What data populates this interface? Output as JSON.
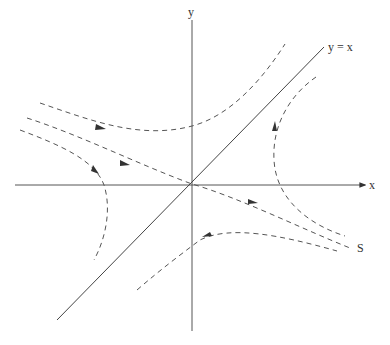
{
  "diagram": {
    "axes": {
      "x_label": "x",
      "y_label": "y"
    },
    "diagonal_label": "y = x",
    "separatrix_label": "S",
    "colors": {
      "lines": "#555555",
      "background": "#ffffff"
    }
  }
}
